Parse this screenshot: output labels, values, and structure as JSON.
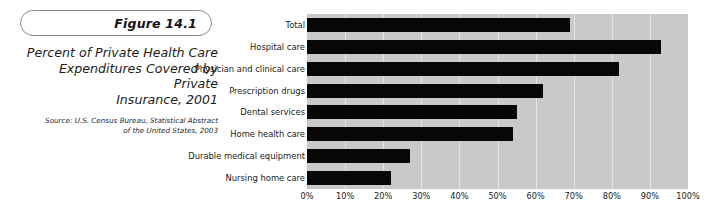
{
  "figure": {
    "badge_label": "Figure 14.1",
    "title": "Percent of Private Health Care Expenditures Covered by Private Insurance, 2001",
    "title_line1": "Percent of Private Health Care",
    "title_line2": "Expenditures Covered by Private",
    "title_line3": "Insurance, 2001",
    "source_line1": "Source: U.S. Census Bureau, Statistical Abstract",
    "source_line2": "of the United States, 2003",
    "source": "Source: U.S. Census Bureau, Statistical Abstract of the United States, 2003"
  },
  "colors": {
    "bar": "#070707",
    "plot_background": "#c9c9c9",
    "gridline": "#e4e4e4",
    "page_background": "#ffffff",
    "badge_border": "#8a8a8a",
    "text": "#1a1a1a"
  },
  "chart_data": {
    "type": "bar",
    "orientation": "horizontal",
    "title": "Percent of Private Health Care Expenditures Covered by Private Insurance, 2001",
    "xlabel": "",
    "ylabel": "",
    "categories": [
      "Total",
      "Hospital care",
      "Physician and clinical care",
      "Prescription drugs",
      "Dental services",
      "Home health care",
      "Durable medical equipment",
      "Nursing home care"
    ],
    "values": [
      69,
      93,
      82,
      62,
      55,
      54,
      27,
      22
    ],
    "xlim": [
      0,
      100
    ],
    "xtick_values": [
      0,
      10,
      20,
      30,
      40,
      50,
      60,
      70,
      80,
      90,
      100
    ],
    "xtick_labels": [
      "0%",
      "10%",
      "20%",
      "30%",
      "40%",
      "50%",
      "60%",
      "70%",
      "80%",
      "90%",
      "100%"
    ],
    "grid": true,
    "grid_axis": "x",
    "legend": false,
    "legend_position": "none",
    "series": [
      {
        "name": "Percent covered by private insurance",
        "values": [
          69,
          93,
          82,
          62,
          55,
          54,
          27,
          22
        ]
      }
    ]
  }
}
